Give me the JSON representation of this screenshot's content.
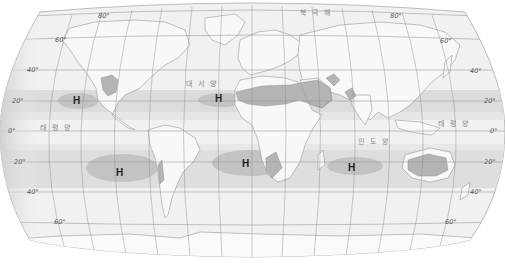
{
  "map": {
    "projection": "Robinson-style pseudo-cylindrical world map",
    "colors": {
      "background": "#ffffff",
      "ocean": "#f0f0f0",
      "land": "#f7f7f7",
      "coastline": "#9a9a9a",
      "graticule": "#8a8a8a",
      "subtropical_band": "#d9d9d9",
      "high_pressure_cell": "#c4c4c4",
      "desert": "#a8a8a8",
      "h_label": "#222222"
    },
    "latitude_labels": {
      "left": [
        {
          "text": "80°",
          "y": 16
        },
        {
          "text": "60°",
          "y": 38
        },
        {
          "text": "40°",
          "y": 70
        },
        {
          "text": "20°",
          "y": 101
        },
        {
          "text": "0°",
          "y": 131
        },
        {
          "text": "20°",
          "y": 163
        },
        {
          "text": "40°",
          "y": 192
        },
        {
          "text": "60°",
          "y": 222
        }
      ],
      "right": [
        {
          "text": "80°",
          "y": 16
        },
        {
          "text": "60°",
          "y": 41
        },
        {
          "text": "40°",
          "y": 71
        },
        {
          "text": "20°",
          "y": 101
        },
        {
          "text": "0°",
          "y": 131
        },
        {
          "text": "20°",
          "y": 163
        },
        {
          "text": "40°",
          "y": 192
        },
        {
          "text": "60°",
          "y": 222
        }
      ]
    },
    "ocean_labels": [
      {
        "id": "arctic",
        "text": "북 극 해",
        "x": 312,
        "y": 14
      },
      {
        "id": "atlantic",
        "text": "대 서 양",
        "x": 199,
        "y": 84
      },
      {
        "id": "pacific-west",
        "text": "태 평 양",
        "x": 52,
        "y": 128
      },
      {
        "id": "indian",
        "text": "인 도 양",
        "x": 371,
        "y": 142
      },
      {
        "id": "pacific-east",
        "text": "태 평 양",
        "x": 451,
        "y": 124
      }
    ],
    "high_pressure_cells": [
      {
        "label": "H",
        "x": 77,
        "y": 100,
        "hemisphere": "north",
        "ocean": "Pacific"
      },
      {
        "label": "H",
        "x": 219,
        "y": 98,
        "hemisphere": "north",
        "ocean": "Atlantic"
      },
      {
        "label": "H",
        "x": 120,
        "y": 172,
        "hemisphere": "south",
        "ocean": "Pacific"
      },
      {
        "label": "H",
        "x": 246,
        "y": 163,
        "hemisphere": "south",
        "ocean": "Atlantic"
      },
      {
        "label": "H",
        "x": 352,
        "y": 167,
        "hemisphere": "south",
        "ocean": "Indian"
      }
    ],
    "shaded_regions": [
      "Northern subtropical high-pressure belt (~20°N–30°N)",
      "Southern subtropical high-pressure belt (~20°S–35°S)",
      "Sahara & Arabian deserts",
      "Southwestern North American desert",
      "Iranian/Thar desert",
      "Australian desert",
      "Namib/Kalahari desert",
      "Atacama desert"
    ]
  }
}
